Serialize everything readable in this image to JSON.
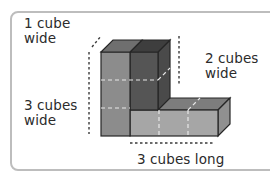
{
  "diagram": {
    "type": "isometric-cube-model",
    "labels": {
      "top_left": "1 cube\nwide",
      "right": "2 cubes\nwide",
      "left": "3 cubes\nwide",
      "bottom": "3 cubes long"
    },
    "colors": {
      "light_gray": "#a6a6a6",
      "mid_gray": "#8c8c8c",
      "dark_gray": "#555555",
      "top_light": "#7d7d7d",
      "top_dark": "#3e3e3e",
      "side_gray": "#909090",
      "edge": "#262626",
      "dashed_guide": "#3a3a3a",
      "hidden_line": "#e8e8e8",
      "frame_border": "#bdbdbd"
    }
  }
}
